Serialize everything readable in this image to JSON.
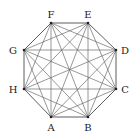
{
  "diagram": {
    "type": "complete-graph",
    "name": "K8 on regular octagon",
    "vertices": [
      {
        "id": "A",
        "label": "A",
        "x": 51,
        "y": 117,
        "lx": 51,
        "ly": 131
      },
      {
        "id": "B",
        "label": "B",
        "x": 88,
        "y": 117,
        "lx": 88,
        "ly": 131
      },
      {
        "id": "C",
        "label": "C",
        "x": 116,
        "y": 89,
        "lx": 125,
        "ly": 93
      },
      {
        "id": "D",
        "label": "D",
        "x": 116,
        "y": 50,
        "lx": 125,
        "ly": 54
      },
      {
        "id": "E",
        "label": "E",
        "x": 88,
        "y": 23,
        "lx": 88,
        "ly": 18
      },
      {
        "id": "F",
        "label": "F",
        "x": 51,
        "y": 23,
        "lx": 51,
        "ly": 18
      },
      {
        "id": "G",
        "label": "G",
        "x": 24,
        "y": 50,
        "lx": 13,
        "ly": 54
      },
      {
        "id": "H",
        "label": "H",
        "x": 24,
        "y": 89,
        "lx": 13,
        "ly": 93
      }
    ],
    "edges": "all pairs (28 edges)",
    "colors": {
      "edge": "#6a6a6a",
      "vertex": "#222222",
      "background": "#ffffff"
    }
  }
}
